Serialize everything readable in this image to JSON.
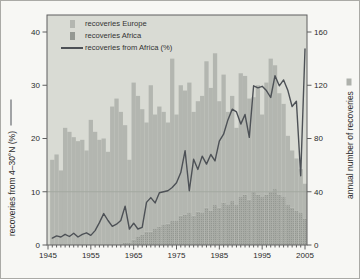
{
  "chart_data": {
    "type": "bar+line",
    "title": "",
    "years": [
      1946,
      1947,
      1948,
      1949,
      1950,
      1951,
      1952,
      1953,
      1954,
      1955,
      1956,
      1957,
      1958,
      1959,
      1960,
      1961,
      1962,
      1963,
      1964,
      1965,
      1966,
      1967,
      1968,
      1969,
      1970,
      1971,
      1972,
      1973,
      1974,
      1975,
      1976,
      1977,
      1978,
      1979,
      1980,
      1981,
      1982,
      1983,
      1984,
      1985,
      1986,
      1987,
      1988,
      1989,
      1990,
      1991,
      1992,
      1993,
      1994,
      1995,
      1996,
      1997,
      1998,
      1999,
      2000,
      2001,
      2002,
      2003,
      2004,
      2005
    ],
    "series": [
      {
        "name": "recoveries Europe",
        "type": "bar",
        "axis": "right",
        "stack": "recoveries",
        "values": [
          64,
          68,
          56,
          88,
          85,
          81,
          78,
          79,
          71,
          94,
          85,
          79,
          80,
          70,
          104,
          110,
          100,
          88,
          62,
          118,
          106,
          94,
          82,
          110,
          86,
          90,
          85,
          76,
          122,
          80,
          98,
          93,
          98,
          78,
          83,
          88,
          110,
          92,
          114,
          80,
          96,
          70,
          79,
          58,
          93,
          89,
          76,
          71,
          82,
          62,
          84,
          100,
          93,
          76,
          70,
          52,
          43,
          39,
          33,
          26
        ]
      },
      {
        "name": "recoveries Africa",
        "type": "bar",
        "axis": "right",
        "stack": "recoveries",
        "values": [
          0,
          0,
          0,
          0,
          0,
          0,
          0,
          0,
          0,
          0,
          0,
          0,
          0,
          0,
          0,
          0,
          0,
          2,
          2,
          4,
          6,
          8,
          10,
          10,
          12,
          14,
          15,
          16,
          18,
          18,
          22,
          23,
          24,
          22,
          25,
          24,
          28,
          26,
          30,
          28,
          32,
          30,
          33,
          30,
          36,
          38,
          34,
          40,
          38,
          36,
          38,
          40,
          42,
          38,
          36,
          30,
          28,
          26,
          24,
          20
        ]
      },
      {
        "name": "recoveries from Africa (%)",
        "type": "line",
        "axis": "left",
        "values": [
          1.3,
          1.7,
          1.5,
          2.0,
          1.6,
          2.2,
          1.5,
          2.0,
          2.3,
          1.8,
          2.7,
          4.2,
          5.9,
          4.6,
          3.5,
          3.9,
          4.6,
          7.3,
          3.0,
          4.1,
          3.0,
          3.3,
          8.0,
          8.9,
          7.9,
          9.8,
          10.0,
          10.2,
          10.8,
          11.7,
          13.6,
          17.7,
          10.2,
          16.1,
          14.2,
          16.7,
          15.2,
          17.0,
          15.8,
          19.5,
          20.8,
          23.5,
          25.5,
          25.0,
          22.7,
          24.5,
          20.2,
          29.9,
          29.5,
          29.8,
          29.0,
          27.7,
          31.8,
          29.9,
          31.0,
          29.0,
          26.0,
          27.0,
          13.0,
          36.8
        ]
      }
    ],
    "left_axis": {
      "label": "recoveries from 4–30°N (%)",
      "min": 0,
      "max": 40,
      "ticks": [
        0,
        10,
        20,
        30,
        40
      ]
    },
    "right_axis": {
      "label": "annual number of recoveries",
      "min": 0,
      "max": 160,
      "ticks": [
        0,
        40,
        80,
        120,
        160
      ]
    },
    "x_axis": {
      "range": [
        1945,
        2005
      ],
      "major_ticks": [
        1945,
        1955,
        1965,
        1975,
        1985,
        1995,
        2005
      ],
      "minor_tick_interval": 1
    },
    "reference_line": {
      "axis": "left",
      "value": 10
    },
    "legend": [
      {
        "label": "recoveries Europe",
        "swatch": "bar-europe"
      },
      {
        "label": "recoveries Africa",
        "swatch": "bar-africa"
      },
      {
        "label": "recoveries from Africa (%)",
        "swatch": "line"
      }
    ],
    "legend_position": "top-left-inside",
    "grid": "single-reference-line",
    "colors": {
      "plot_bg": "#d9dbd4",
      "bar_europe": "#b3b6b0",
      "bar_africa": "#a7aaa4",
      "bar_africa_dot": "#949892",
      "line": "#4d5156",
      "reference_line": "#a3a8a0",
      "frame": "#5f5f5f",
      "text": "#2b2b2b"
    }
  }
}
